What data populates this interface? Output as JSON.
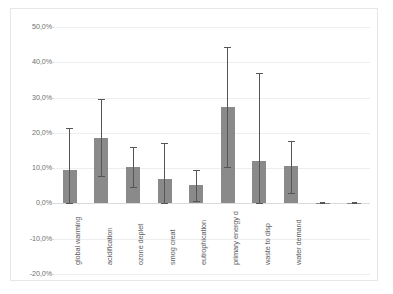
{
  "chart_data": {
    "type": "bar",
    "title": "",
    "xlabel": "",
    "ylabel": "",
    "ylim": [
      -20,
      50
    ],
    "grid": true,
    "legend_position": "none",
    "value_format": "percent-comma",
    "ytick_labels": [
      "50,0%",
      "40,0%",
      "30,0%",
      "20,0%",
      "10,0%",
      "0,0%",
      "-10,0%",
      "-20,0%"
    ],
    "ytick_values": [
      50,
      40,
      30,
      20,
      10,
      0,
      -10,
      -20
    ],
    "categories": [
      "global warming",
      "acidification",
      "ozone deplet",
      "smog creat",
      "eutrophication",
      "primary energy d",
      "waste to disp",
      "water demand",
      "",
      ""
    ],
    "values": [
      9.4,
      18.5,
      10.4,
      6.8,
      5.2,
      27.3,
      12.0,
      10.5,
      0.2,
      0.2
    ],
    "error_high": [
      21.5,
      29.7,
      16.1,
      17.0,
      9.6,
      44.4,
      37.0,
      17.7,
      0.3,
      0.3
    ],
    "error_low": [
      0.0,
      7.8,
      4.7,
      0.2,
      0.7,
      10.3,
      0.0,
      2.9,
      0.1,
      0.1
    ],
    "series": [
      {
        "name": "mean",
        "values": [
          9.4,
          18.5,
          10.4,
          6.8,
          5.2,
          27.3,
          12.0,
          10.5,
          0.2,
          0.2
        ]
      }
    ],
    "bar_color": "#808080",
    "error_bar_color": "#555555",
    "gridline_color": "#eceef0",
    "border_color": "#e4e6e8",
    "background": "#ffffff"
  }
}
